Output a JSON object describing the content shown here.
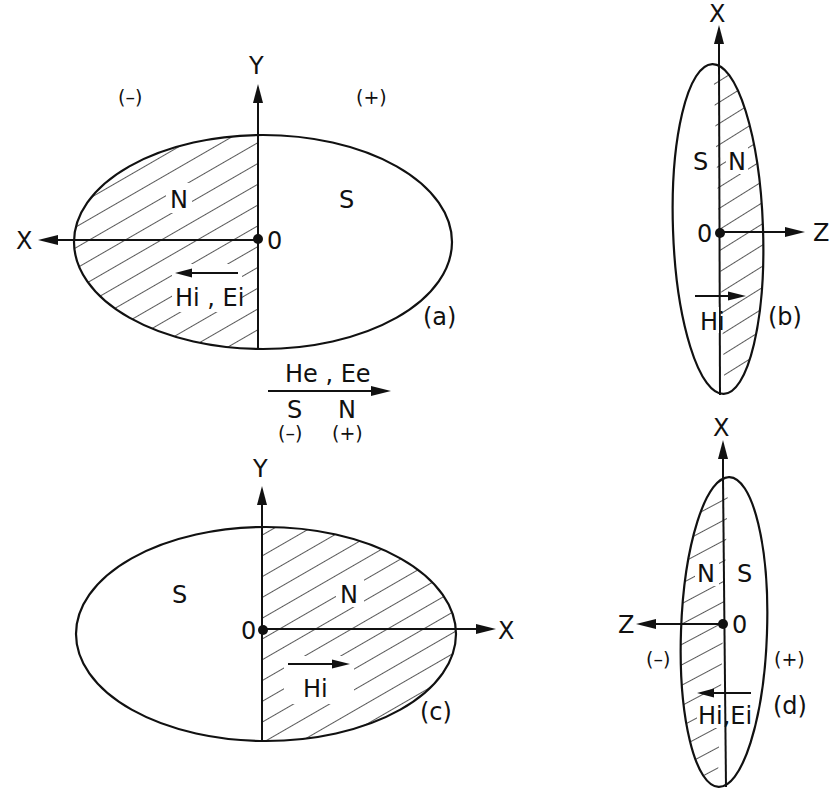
{
  "figure": {
    "background": "#ffffff",
    "ink": "#111111",
    "panels": {
      "a": {
        "tag": "(a)",
        "axis_vertical": "Y",
        "axis_horizontal": "X",
        "origin": "0",
        "left_region": "N",
        "right_region": "S",
        "internal_field": "Hi , Ei",
        "sign_left": "(–)",
        "sign_right": "(+)",
        "hatched_side": "left",
        "internal_field_direction": "left"
      },
      "b": {
        "tag": "(b)",
        "axis_vertical": "X",
        "axis_horizontal": "Z",
        "origin": "0",
        "left_region": "S",
        "right_region": "N",
        "internal_field": "Hi",
        "hatched_side": "right",
        "internal_field_direction": "right"
      },
      "c": {
        "tag": "(c)",
        "axis_vertical": "Y",
        "axis_horizontal": "X",
        "origin": "0",
        "left_region": "S",
        "right_region": "N",
        "internal_field": "Hi",
        "hatched_side": "right",
        "internal_field_direction": "right"
      },
      "d": {
        "tag": "(d)",
        "axis_vertical": "X",
        "axis_horizontal": "Z",
        "origin": "0",
        "left_region": "N",
        "right_region": "S",
        "internal_field": "Hi,Ei",
        "sign_left": "(–)",
        "sign_right": "(+)",
        "hatched_side": "left",
        "internal_field_direction": "left"
      }
    },
    "external_field": {
      "label": "He , Ee",
      "pole_left": "S",
      "pole_right": "N",
      "sign_left": "(–)",
      "sign_right": "(+)",
      "direction": "right"
    }
  }
}
